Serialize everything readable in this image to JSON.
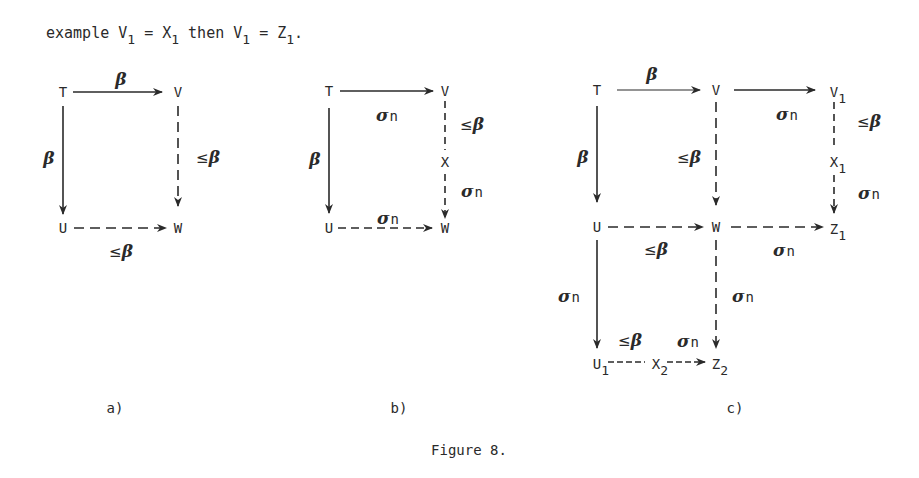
{
  "intro": {
    "prefix": "example V",
    "s1": "1",
    "eq1": " = X",
    "s2": "1",
    "mid": " then V",
    "s3": "1",
    "eq2": " = Z",
    "s4": "1",
    "end": "."
  },
  "labels": {
    "beta": "β",
    "le": "≤",
    "sigma": "σ",
    "n": "n"
  },
  "diagrams": {
    "a": {
      "caption": "a)",
      "nodes": {
        "T": "T",
        "V": "V",
        "U": "U",
        "W": "W"
      },
      "edges": [
        {
          "from": "T",
          "to": "V",
          "style": "solid",
          "label": "β"
        },
        {
          "from": "T",
          "to": "U",
          "style": "solid",
          "label": "β"
        },
        {
          "from": "V",
          "to": "W",
          "style": "dashed",
          "label": "≤β"
        },
        {
          "from": "U",
          "to": "W",
          "style": "dashed",
          "label": "≤β"
        }
      ]
    },
    "b": {
      "caption": "b)",
      "nodes": {
        "T": "T",
        "V": "V",
        "X": "X",
        "U": "U",
        "W": "W"
      },
      "edges": [
        {
          "from": "T",
          "to": "V",
          "style": "solid",
          "label": "σn"
        },
        {
          "from": "T",
          "to": "U",
          "style": "solid",
          "label": "β"
        },
        {
          "from": "V",
          "to": "X",
          "style": "dashed",
          "label": "≤β"
        },
        {
          "from": "X",
          "to": "W",
          "style": "dashed",
          "label": "σn"
        },
        {
          "from": "U",
          "to": "W",
          "style": "dashed",
          "label": "σn"
        }
      ]
    },
    "c": {
      "caption": "c)",
      "nodes": {
        "T": "T",
        "V": "V",
        "V1": "V",
        "V1_sub": "1",
        "X1": "X",
        "X1_sub": "1",
        "U": "U",
        "W": "W",
        "Z1": "Z",
        "Z1_sub": "1",
        "U1": "U",
        "U1_sub": "1",
        "X2": "X",
        "X2_sub": "2",
        "Z2": "Z",
        "Z2_sub": "2"
      },
      "edges": [
        {
          "from": "T",
          "to": "V",
          "style": "solid",
          "label": "β"
        },
        {
          "from": "V",
          "to": "V1",
          "style": "solid",
          "label": "σn"
        },
        {
          "from": "T",
          "to": "U",
          "style": "solid",
          "label": "β"
        },
        {
          "from": "V",
          "to": "W",
          "style": "dashed",
          "label": "≤β"
        },
        {
          "from": "V1",
          "to": "X1",
          "style": "dashed",
          "label": "≤β"
        },
        {
          "from": "X1",
          "to": "Z1",
          "style": "dashed",
          "label": "σn"
        },
        {
          "from": "U",
          "to": "W",
          "style": "dashed",
          "label": "≤β"
        },
        {
          "from": "W",
          "to": "Z1",
          "style": "dashed",
          "label": "σn"
        },
        {
          "from": "U",
          "to": "U1",
          "style": "solid",
          "label": "σn"
        },
        {
          "from": "W",
          "to": "Z2",
          "style": "dashed",
          "label": "σn"
        },
        {
          "from": "U1",
          "to": "X2",
          "style": "dashed",
          "label": "≤β"
        },
        {
          "from": "X2",
          "to": "Z2",
          "style": "dashed",
          "label": "σn"
        }
      ]
    }
  },
  "figure_caption": "Figure 8."
}
